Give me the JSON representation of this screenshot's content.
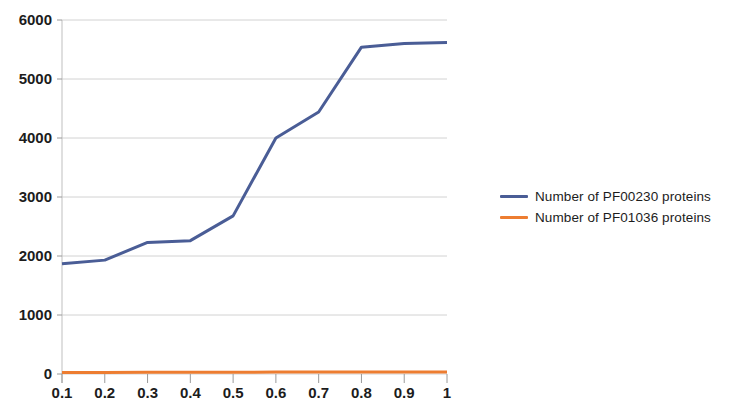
{
  "chart_data": {
    "type": "line",
    "title": "",
    "xlabel": "",
    "ylabel": "",
    "x": [
      0.1,
      0.2,
      0.3,
      0.4,
      0.5,
      0.6,
      0.7,
      0.8,
      0.9,
      1
    ],
    "xtick_labels": [
      "0.1",
      "0.2",
      "0.3",
      "0.4",
      "0.5",
      "0.6",
      "0.7",
      "0.8",
      "0.9",
      "1"
    ],
    "ytick_labels": [
      "0",
      "1000",
      "2000",
      "3000",
      "4000",
      "5000",
      "6000"
    ],
    "yticks": [
      0,
      1000,
      2000,
      3000,
      4000,
      5000,
      6000
    ],
    "ylim": [
      0,
      6000
    ],
    "xlim": [
      0.1,
      1
    ],
    "grid": true,
    "legend_position": "right",
    "series": [
      {
        "name": "Number of PF00230 proteins",
        "color": "#4a5d96",
        "values": [
          1870,
          1930,
          2230,
          2260,
          2680,
          4000,
          4440,
          5540,
          5600,
          5620
        ]
      },
      {
        "name": "Number of PF01036 proteins",
        "color": "#ed7d31",
        "values": [
          25,
          25,
          28,
          28,
          30,
          32,
          33,
          35,
          36,
          36
        ]
      }
    ]
  },
  "legend": {
    "items": [
      {
        "label": "Number of PF00230 proteins",
        "color": "#4a5d96"
      },
      {
        "label": "Number of PF01036 proteins",
        "color": "#ed7d31"
      }
    ]
  }
}
